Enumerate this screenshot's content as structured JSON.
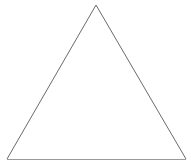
{
  "figure": {
    "name": "triangle-figure",
    "shape_type": "triangle",
    "canvas": {
      "width": 191,
      "height": 166,
      "background_color": "#ffffff"
    },
    "style": {
      "fill_color": "#ffffff",
      "edge_color": "#6b6b6b",
      "base_edge_color": "#9a9a9a",
      "stroke_width": 1
    },
    "vertices": [
      {
        "label": "apex",
        "x": 96,
        "y": 5
      },
      {
        "label": "bottom-right",
        "x": 186,
        "y": 159
      },
      {
        "label": "bottom-left",
        "x": 7,
        "y": 159
      }
    ],
    "points_attribute": "96,5 186,159 7,159",
    "base_line": {
      "x1": 7,
      "y1": 159,
      "x2": 186,
      "y2": 159
    },
    "left_edge": {
      "x1": 7,
      "y1": 159,
      "x2": 96,
      "y2": 5
    },
    "right_edge": {
      "x1": 96,
      "y1": 5,
      "x2": 186,
      "y2": 159
    }
  }
}
